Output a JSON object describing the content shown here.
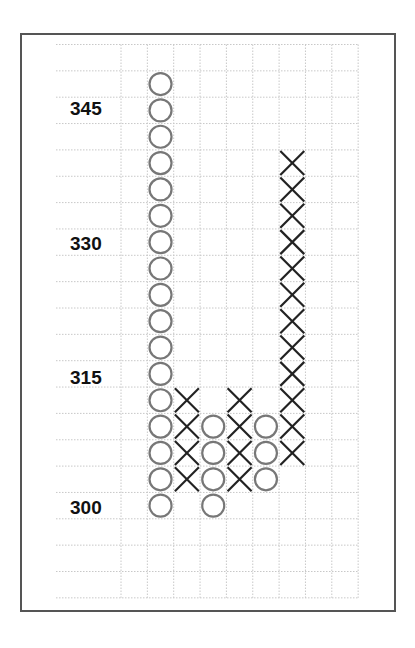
{
  "chart_data": {
    "type": "point_and_figure",
    "title": "",
    "xlabel": "",
    "ylabel": "",
    "box_size": 3,
    "ylim": [
      291,
      351
    ],
    "y_tick_labels": [
      "345",
      "330",
      "315",
      "300"
    ],
    "y_ticks": [
      345,
      330,
      315,
      300
    ],
    "grid": true,
    "grid_rows": 21,
    "grid_cols": 9,
    "columns": [
      {
        "index": 0,
        "type": "empty",
        "values": []
      },
      {
        "index": 1,
        "type": "O",
        "from": 348,
        "to": 300,
        "values": [
          348,
          345,
          342,
          339,
          336,
          333,
          330,
          327,
          324,
          321,
          318,
          315,
          312,
          309,
          306,
          303,
          300
        ]
      },
      {
        "index": 2,
        "type": "X",
        "from": 303,
        "to": 312,
        "values": [
          312,
          309,
          306,
          303
        ]
      },
      {
        "index": 3,
        "type": "O",
        "from": 309,
        "to": 300,
        "values": [
          309,
          306,
          303,
          300
        ]
      },
      {
        "index": 4,
        "type": "X",
        "from": 303,
        "to": 312,
        "values": [
          312,
          309,
          306,
          303
        ]
      },
      {
        "index": 5,
        "type": "O",
        "from": 309,
        "to": 303,
        "values": [
          309,
          306,
          303
        ]
      },
      {
        "index": 6,
        "type": "X",
        "from": 306,
        "to": 339,
        "values": [
          339,
          336,
          333,
          330,
          327,
          324,
          321,
          318,
          315,
          312,
          309,
          306
        ]
      },
      {
        "index": 7,
        "type": "empty",
        "values": []
      },
      {
        "index": 8,
        "type": "empty",
        "values": []
      }
    ]
  },
  "style": {
    "o_color": "#777777",
    "x_color": "#222222",
    "grid_color": "#c8c8c8",
    "frame_color": "#555555"
  },
  "labels": {
    "l345": "345",
    "l330": "330",
    "l315": "315",
    "l300": "300"
  }
}
